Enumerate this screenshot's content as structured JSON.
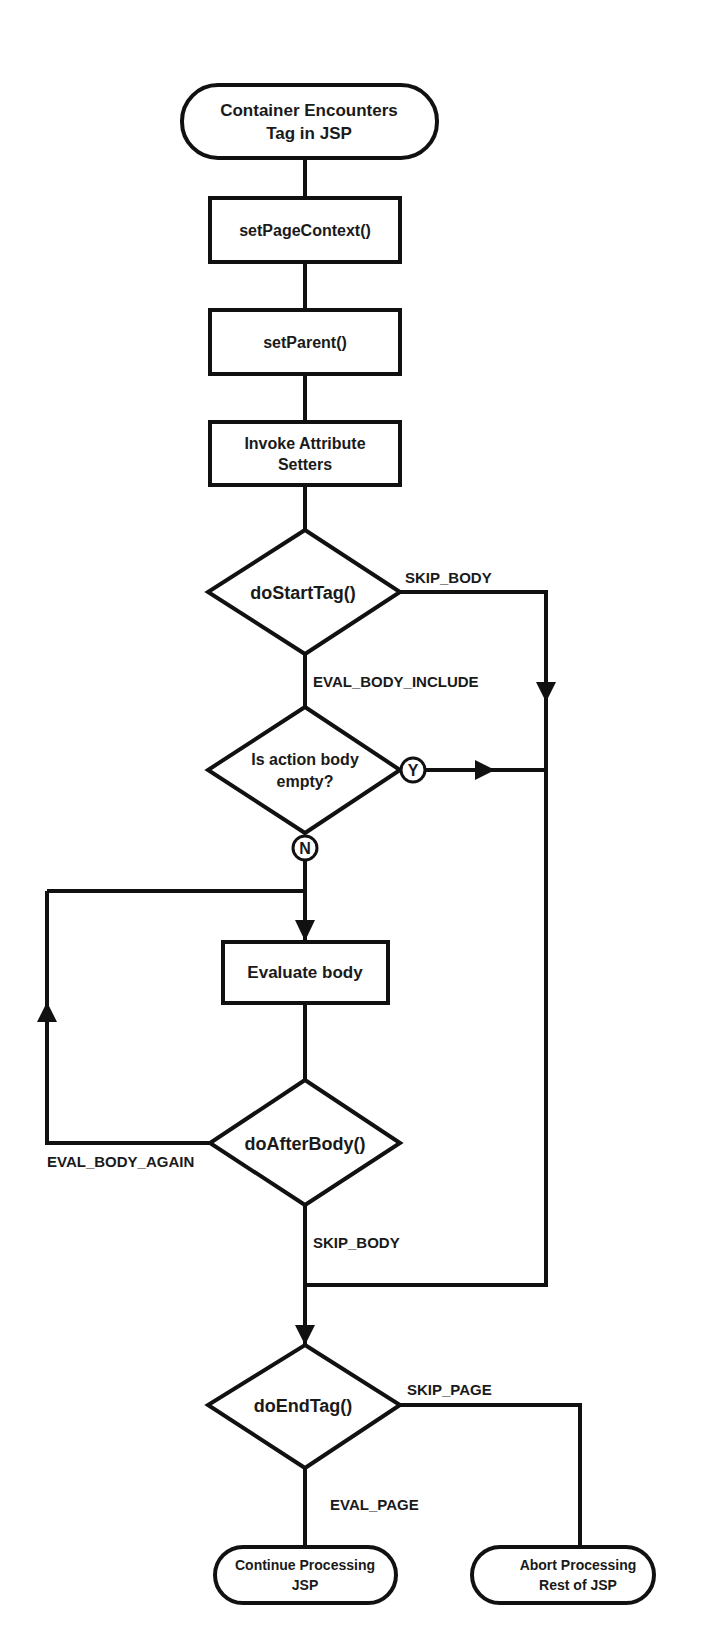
{
  "diagram": {
    "type": "flowchart",
    "colors": {
      "stroke": "#111111",
      "fill": "#ffffff",
      "text": "#1a1a1a"
    },
    "nodes": {
      "start": {
        "shape": "terminal",
        "lines": [
          "Container Encounters",
          "Tag in JSP"
        ]
      },
      "set_page_context": {
        "shape": "process",
        "lines": [
          "setPageContext()"
        ]
      },
      "set_parent": {
        "shape": "process",
        "lines": [
          "setParent()"
        ]
      },
      "invoke_setters": {
        "shape": "process",
        "lines": [
          "Invoke Attribute",
          "Setters"
        ]
      },
      "do_start_tag": {
        "shape": "decision",
        "lines": [
          "doStartTag()"
        ]
      },
      "body_empty": {
        "shape": "decision",
        "lines": [
          "Is action body",
          "empty?"
        ]
      },
      "evaluate_body": {
        "shape": "process",
        "lines": [
          "Evaluate body"
        ]
      },
      "do_after_body": {
        "shape": "decision",
        "lines": [
          "doAfterBody()"
        ]
      },
      "do_end_tag": {
        "shape": "decision",
        "lines": [
          "doEndTag()"
        ]
      },
      "continue": {
        "shape": "terminal",
        "lines": [
          "Continue Processing",
          "JSP"
        ]
      },
      "abort": {
        "shape": "terminal",
        "lines": [
          "Abort Processing",
          "Rest of JSP"
        ]
      }
    },
    "edge_labels": {
      "start_skip_body": "SKIP_BODY",
      "start_eval_body_include": "EVAL_BODY_INCLUDE",
      "empty_yes": "Y",
      "empty_no": "N",
      "after_eval_body_again": "EVAL_BODY_AGAIN",
      "after_skip_body": "SKIP_BODY",
      "end_skip_page": "SKIP_PAGE",
      "end_eval_page": "EVAL_PAGE"
    },
    "edges": [
      {
        "from": "start",
        "to": "set_page_context"
      },
      {
        "from": "set_page_context",
        "to": "set_parent"
      },
      {
        "from": "set_parent",
        "to": "invoke_setters"
      },
      {
        "from": "invoke_setters",
        "to": "do_start_tag"
      },
      {
        "from": "do_start_tag",
        "to": "body_empty",
        "label": "EVAL_BODY_INCLUDE"
      },
      {
        "from": "do_start_tag",
        "to": "do_end_tag",
        "label": "SKIP_BODY"
      },
      {
        "from": "body_empty",
        "to": "do_end_tag",
        "label": "Y"
      },
      {
        "from": "body_empty",
        "to": "evaluate_body",
        "label": "N"
      },
      {
        "from": "evaluate_body",
        "to": "do_after_body"
      },
      {
        "from": "do_after_body",
        "to": "evaluate_body",
        "label": "EVAL_BODY_AGAIN"
      },
      {
        "from": "do_after_body",
        "to": "do_end_tag",
        "label": "SKIP_BODY"
      },
      {
        "from": "do_end_tag",
        "to": "continue",
        "label": "EVAL_PAGE"
      },
      {
        "from": "do_end_tag",
        "to": "abort",
        "label": "SKIP_PAGE"
      }
    ]
  }
}
